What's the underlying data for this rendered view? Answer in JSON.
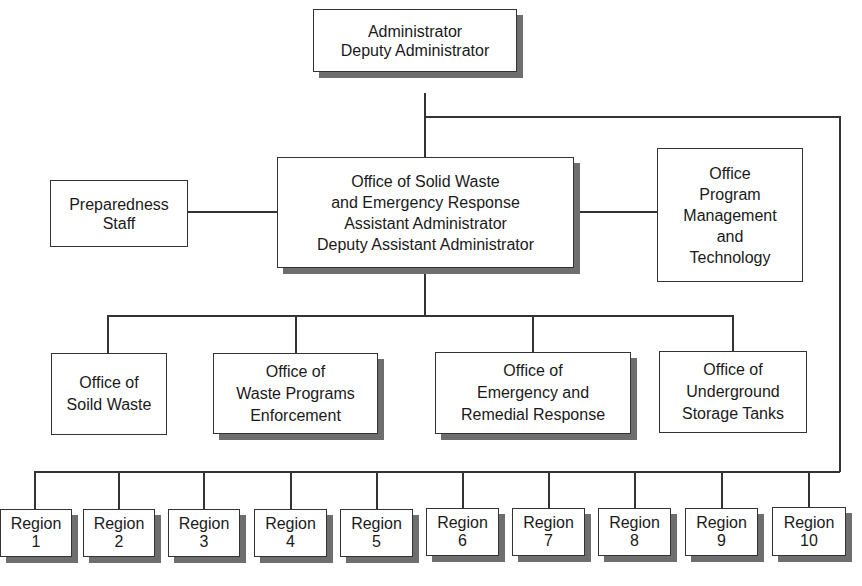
{
  "chart_title": "EPA Solid Waste and Emergency Response organization chart",
  "nodes": {
    "administrator": {
      "lines": [
        "Administrator",
        "Deputy Administrator"
      ]
    },
    "preparedness": {
      "lines": [
        "Preparedness",
        "Staff"
      ]
    },
    "oswer": {
      "lines": [
        "Office of Solid Waste",
        "and Emergency Response",
        "Assistant Administrator",
        "Deputy Assistant Administrator"
      ]
    },
    "opmt": {
      "lines": [
        "Office",
        "Program",
        "Management",
        "and",
        "Technology"
      ]
    },
    "solid_waste": {
      "lines": [
        "Office of",
        "Soild Waste"
      ]
    },
    "waste_enforcement": {
      "lines": [
        "Office of",
        "Waste Programs",
        "Enforcement"
      ]
    },
    "emergency_remedial": {
      "lines": [
        "Office of",
        "Emergency and",
        "Remedial Response"
      ]
    },
    "underground_tanks": {
      "lines": [
        "Office of",
        "Underground",
        "Storage Tanks"
      ]
    }
  },
  "regions": [
    {
      "label": "Region",
      "number": "1"
    },
    {
      "label": "Region",
      "number": "2"
    },
    {
      "label": "Region",
      "number": "3"
    },
    {
      "label": "Region",
      "number": "4"
    },
    {
      "label": "Region",
      "number": "5"
    },
    {
      "label": "Region",
      "number": "6"
    },
    {
      "label": "Region",
      "number": "7"
    },
    {
      "label": "Region",
      "number": "8"
    },
    {
      "label": "Region",
      "number": "9"
    },
    {
      "label": "Region",
      "number": "10"
    }
  ],
  "colors": {
    "line": "#333333",
    "shadow": "#6e6e6e",
    "background": "#ffffff"
  }
}
